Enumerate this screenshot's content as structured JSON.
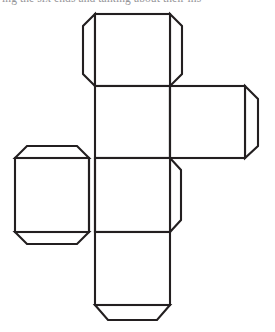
{
  "page": {
    "width": 275,
    "height": 332,
    "background_color": "#ffffff",
    "caption_partial_text": "ing the six ends and talking about their ins"
  },
  "figure": {
    "name": "cube-net",
    "stroke_color": "#231f20",
    "fill_color": "#ffffff",
    "stroke_width": 2.1,
    "grid": {
      "columns": [
        {
          "id": "left",
          "x_start": 15,
          "x_end": 89
        },
        {
          "id": "center",
          "x_start": 95,
          "x_end": 170
        },
        {
          "id": "right",
          "x_start": 170,
          "x_end": 245
        }
      ],
      "rows": [
        {
          "id": "row1",
          "y_start": 14,
          "y_end": 86
        },
        {
          "id": "row2",
          "y_start": 86,
          "y_end": 158
        },
        {
          "id": "row3",
          "y_start": 158,
          "y_end": 232
        },
        {
          "id": "row4",
          "y_start": 232,
          "y_end": 305
        }
      ]
    },
    "faces": [
      {
        "id": "face-top",
        "label": "top square",
        "column": "center",
        "row": "row1"
      },
      {
        "id": "face-upper-middle",
        "label": "upper middle square",
        "column": "center",
        "row": "row2"
      },
      {
        "id": "face-right",
        "label": "right square",
        "column": "right",
        "row": "row2"
      },
      {
        "id": "face-left",
        "label": "left square",
        "column": "left",
        "row": "row3"
      },
      {
        "id": "face-lower-middle",
        "label": "lower middle square",
        "column": "center",
        "row": "row3"
      },
      {
        "id": "face-bottom",
        "label": "bottom square",
        "column": "center",
        "row": "row4"
      }
    ],
    "tabs": [
      {
        "id": "tab-top-left",
        "attached_to": "face-top",
        "edge": "left",
        "shape": "trapezoid",
        "depth": 12
      },
      {
        "id": "tab-top-right",
        "attached_to": "face-top",
        "edge": "right",
        "shape": "trapezoid",
        "depth": 12
      },
      {
        "id": "tab-right-right",
        "attached_to": "face-right",
        "edge": "right",
        "shape": "trapezoid",
        "depth": 12
      },
      {
        "id": "tab-left-top",
        "attached_to": "face-left",
        "edge": "top",
        "shape": "trapezoid",
        "depth": 12
      },
      {
        "id": "tab-left-bottom",
        "attached_to": "face-left",
        "edge": "bottom",
        "shape": "trapezoid",
        "depth": 12
      },
      {
        "id": "tab-lower-middle-right",
        "attached_to": "face-lower-middle",
        "edge": "right",
        "shape": "trapezoid",
        "depth": 10
      },
      {
        "id": "tab-bottom-bottom",
        "attached_to": "face-bottom",
        "edge": "bottom",
        "shape": "trapezoid",
        "depth": 14
      }
    ],
    "fold_lines": [
      {
        "id": "fold-h-row1-row2",
        "orientation": "horizontal",
        "from": [
          95,
          86
        ],
        "to": [
          170,
          86
        ]
      },
      {
        "id": "fold-h-row2-row3",
        "orientation": "horizontal",
        "from": [
          15,
          158
        ],
        "to": [
          245,
          158
        ]
      },
      {
        "id": "fold-h-row3-row4",
        "orientation": "horizontal",
        "from": [
          95,
          232
        ],
        "to": [
          170,
          232
        ]
      },
      {
        "id": "fold-v-center-right",
        "orientation": "vertical",
        "from": [
          170,
          86
        ],
        "to": [
          170,
          158
        ]
      },
      {
        "id": "fold-v-left-center",
        "orientation": "vertical",
        "from": [
          95,
          158
        ],
        "to": [
          95,
          232
        ]
      }
    ]
  }
}
